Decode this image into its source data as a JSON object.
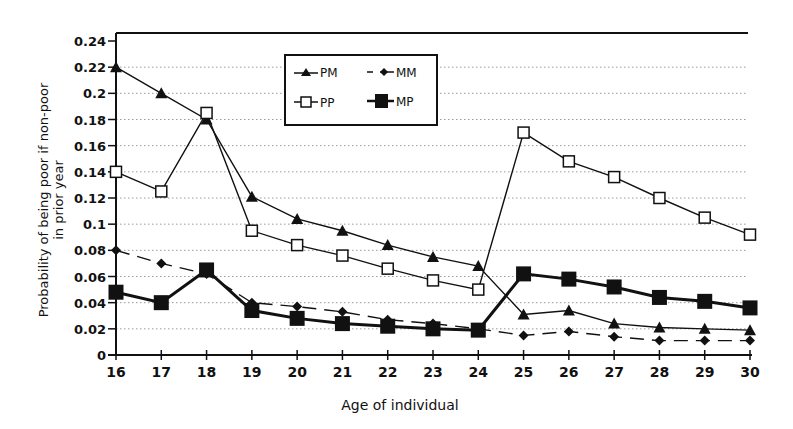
{
  "chart_data": {
    "type": "line",
    "title": "",
    "xlabel": "Age of individual",
    "ylabel": "Probability of being poor if non-poor in prior year",
    "ylabel_lines": [
      "Probability of being poor if non-poor",
      "in prior year"
    ],
    "x": [
      16,
      17,
      18,
      19,
      20,
      21,
      22,
      23,
      24,
      25,
      26,
      27,
      28,
      29,
      30
    ],
    "xlim": [
      16,
      30
    ],
    "ylim": [
      0,
      0.24
    ],
    "yticks": [
      0,
      0.02,
      0.04,
      0.06,
      0.08,
      0.1,
      0.12,
      0.14,
      0.16,
      0.18,
      0.2,
      0.22,
      0.24
    ],
    "ytick_labels": [
      "0",
      "0.02",
      "0.04",
      "0.06",
      "0.08",
      "0.1",
      "0.12",
      "0.14",
      "0.16",
      "0.18",
      "0.2",
      "0.22",
      "0.24"
    ],
    "grid": "horizontal dotted",
    "legend_position": "upper center, inside plot",
    "series": [
      {
        "name": "PM",
        "marker": "triangle",
        "line": "solid",
        "values": [
          0.22,
          0.2,
          0.18,
          0.121,
          0.104,
          0.095,
          0.084,
          0.075,
          0.068,
          0.031,
          0.034,
          0.024,
          0.021,
          0.02,
          0.019
        ]
      },
      {
        "name": "MM",
        "marker": "diamond",
        "line": "dashed",
        "values": [
          0.08,
          0.07,
          0.062,
          0.04,
          0.037,
          0.033,
          0.027,
          0.024,
          0.02,
          0.015,
          0.018,
          0.014,
          0.011,
          0.011,
          0.011
        ]
      },
      {
        "name": "PP",
        "marker": "open-square",
        "line": "solid",
        "values": [
          0.14,
          0.125,
          0.185,
          0.095,
          0.084,
          0.076,
          0.066,
          0.057,
          0.05,
          0.17,
          0.148,
          0.136,
          0.12,
          0.105,
          0.092
        ]
      },
      {
        "name": "MP",
        "marker": "filled-square",
        "line": "thick-solid",
        "values": [
          0.048,
          0.04,
          0.065,
          0.034,
          0.028,
          0.024,
          0.022,
          0.02,
          0.019,
          0.062,
          0.058,
          0.052,
          0.044,
          0.041,
          0.036
        ]
      }
    ]
  },
  "legend": {
    "items": [
      {
        "label": "PM"
      },
      {
        "label": "MM"
      },
      {
        "label": "PP"
      },
      {
        "label": "MP"
      }
    ]
  },
  "colors": {
    "ink": "#111111",
    "grid": "#9a9a9a",
    "background": "#ffffff"
  }
}
